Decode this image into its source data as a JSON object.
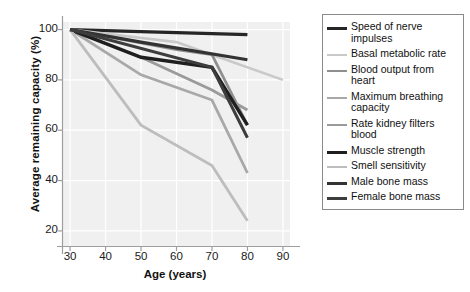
{
  "chart_data": {
    "type": "line",
    "title": "",
    "xlabel": "Age (years)",
    "ylabel": "Average remaining capacity (%)",
    "xlim": [
      28,
      92
    ],
    "ylim": [
      14,
      103
    ],
    "xticks": [
      30,
      40,
      50,
      60,
      70,
      80,
      90
    ],
    "yticks": [
      20,
      40,
      60,
      80,
      100
    ],
    "grid": true,
    "legend_position": "right",
    "series": [
      {
        "name": "Speed of nerve impulses",
        "color": "#262626",
        "width": 3.2,
        "x": [
          30,
          80
        ],
        "values": [
          100,
          98
        ]
      },
      {
        "name": "Basal metabolic rate",
        "color": "#c9c9c9",
        "width": 2.6,
        "x": [
          30,
          60,
          70,
          90
        ],
        "values": [
          100,
          95,
          90,
          80
        ]
      },
      {
        "name": "Blood output from heart",
        "color": "#8f8f8f",
        "width": 2.8,
        "x": [
          30,
          60,
          70,
          80
        ],
        "values": [
          100,
          92,
          90,
          62
        ]
      },
      {
        "name": "Maximum breathing capacity",
        "color": "#a8a8a8",
        "width": 2.8,
        "x": [
          30,
          50,
          70,
          80
        ],
        "values": [
          100,
          82,
          72,
          43
        ]
      },
      {
        "name": "Rate kidney filters blood",
        "color": "#9a9a9a",
        "width": 2.8,
        "x": [
          30,
          50,
          70,
          80
        ],
        "values": [
          100,
          89,
          76,
          68
        ]
      },
      {
        "name": "Muscle strength",
        "color": "#1f1f1f",
        "width": 3.4,
        "x": [
          30,
          50,
          70,
          80
        ],
        "values": [
          100,
          89,
          85,
          62
        ]
      },
      {
        "name": "Smell sensitivity",
        "color": "#bdbdbd",
        "width": 2.8,
        "x": [
          30,
          50,
          70,
          80
        ],
        "values": [
          100,
          62,
          46,
          24
        ]
      },
      {
        "name": "Male bone mass",
        "color": "#333333",
        "width": 3.2,
        "x": [
          30,
          50,
          80
        ],
        "values": [
          100,
          95,
          88
        ]
      },
      {
        "name": "Female bone mass",
        "color": "#3d3d3d",
        "width": 3.0,
        "x": [
          30,
          70,
          80
        ],
        "values": [
          100,
          85,
          57
        ]
      }
    ]
  },
  "legend": {
    "items": [
      {
        "label": "Speed of nerve impulses",
        "color": "#262626",
        "thickness": 3.2
      },
      {
        "label": "Basal metabolic rate",
        "color": "#c9c9c9",
        "thickness": 2.4
      },
      {
        "label": "Blood output from heart",
        "color": "#8f8f8f",
        "thickness": 2.8
      },
      {
        "label": "Maximum breathing capacity",
        "color": "#a8a8a8",
        "thickness": 2.8
      },
      {
        "label": "Rate kidney filters blood",
        "color": "#9a9a9a",
        "thickness": 2.8
      },
      {
        "label": "Muscle strength",
        "color": "#1f1f1f",
        "thickness": 3.6
      },
      {
        "label": "Smell sensitivity",
        "color": "#bdbdbd",
        "thickness": 2.4
      },
      {
        "label": "Male bone mass",
        "color": "#333333",
        "thickness": 3.4
      },
      {
        "label": "Female bone mass",
        "color": "#3d3d3d",
        "thickness": 3.2
      }
    ]
  },
  "colors": {
    "plot_background": "#f0f0f0",
    "gridline": "#ffffff",
    "axis": "#9e9e9e",
    "text": "#111111",
    "legend_border": "#8a8a8a"
  }
}
